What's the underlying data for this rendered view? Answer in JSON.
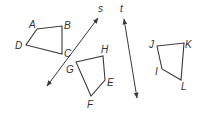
{
  "diagram": {
    "colors": {
      "stroke": "#3a3a3a",
      "label": "#333333",
      "background": "#ffffff"
    },
    "lines": [
      {
        "name": "s",
        "label": "s",
        "from": [
          47,
          86
        ],
        "to": [
          98,
          18
        ],
        "label_pos": [
          98,
          12
        ]
      },
      {
        "name": "t",
        "label": "t",
        "from": [
          124,
          19
        ],
        "to": [
          137,
          98
        ],
        "label_pos": [
          120,
          12
        ]
      }
    ],
    "quadrilaterals": [
      {
        "name": "ABCD",
        "points": [
          [
            37,
            29
          ],
          [
            62,
            26
          ],
          [
            62,
            54
          ],
          [
            26,
            45
          ]
        ],
        "labels": [
          {
            "text": "A",
            "pos": [
              29,
              28
            ]
          },
          {
            "text": "B",
            "pos": [
              64,
              29
            ]
          },
          {
            "text": "C",
            "pos": [
              64,
              57
            ]
          },
          {
            "text": "D",
            "pos": [
              15,
              49
            ]
          }
        ]
      },
      {
        "name": "GHEF",
        "points": [
          [
            76,
            62
          ],
          [
            103,
            56
          ],
          [
            105,
            80
          ],
          [
            91,
            96
          ]
        ],
        "labels": [
          {
            "text": "G",
            "pos": [
              66,
              73
            ]
          },
          {
            "text": "H",
            "pos": [
              101,
              53
            ]
          },
          {
            "text": "E",
            "pos": [
              107,
              86
            ]
          },
          {
            "text": "F",
            "pos": [
              87,
              108
            ]
          }
        ]
      },
      {
        "name": "JKLI",
        "points": [
          [
            157,
            46
          ],
          [
            184,
            43
          ],
          [
            181,
            80
          ],
          [
            162,
            69
          ]
        ],
        "labels": [
          {
            "text": "J",
            "pos": [
              149,
              48
            ]
          },
          {
            "text": "K",
            "pos": [
              185,
              48
            ]
          },
          {
            "text": "L",
            "pos": [
              181,
              90
            ]
          },
          {
            "text": "I",
            "pos": [
              155,
              75
            ]
          }
        ]
      }
    ]
  }
}
